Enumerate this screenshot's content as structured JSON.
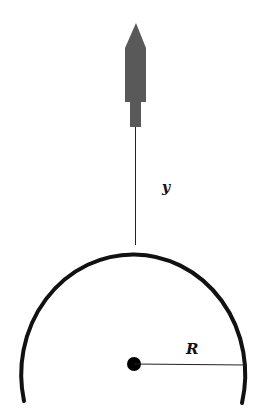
{
  "diagram": {
    "labels": {
      "height": "y",
      "radius": "R"
    },
    "colors": {
      "rocket": "#595959",
      "planet_outline": "#111111",
      "lines": "#222222",
      "center_dot": "#000000"
    }
  }
}
